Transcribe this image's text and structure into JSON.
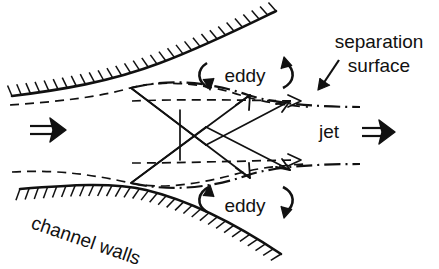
{
  "figure": {
    "background_color": "#ffffff",
    "ink_color": "#111111",
    "width": 439,
    "height": 269
  },
  "labels": {
    "separation_line1": "separation",
    "separation_line2": "surface",
    "jet": "jet",
    "jet_arrow_glyph": "⇒",
    "inlet_arrow_glyph": "⇒",
    "eddy_top": "eddy",
    "eddy_bottom": "eddy",
    "channel_walls": "channel walls"
  },
  "geometry": {
    "top_wall_path": "M 12,96 C 60,90 110,82 160,63 C 205,46 245,26 276,11",
    "bottom_wall_path": "M 20,189 C 70,185 112,182 146,190 C 196,202 245,230 281,254",
    "top_streamline_path": "M 10,105 C 55,102 100,97 130,88 C 160,80 200,82 240,95 C 262,102 290,106 308,107",
    "bottom_streamline_path": "M 12,172 C 58,169 100,176 130,183 C 162,190 200,184 240,173 C 262,167 288,165 306,164",
    "top_sep_surface_path": "M 131,88 C 170,78 210,82 248,95 C 275,104 320,107 360,107",
    "bottom_sep_surface_path": "M 131,183 C 170,192 212,188 248,175 C 276,166 322,164 360,164",
    "top_jet_dash_path": "M 132,101 C 180,99 240,100 296,101",
    "bottom_jet_dash_path": "M 132,163 C 180,163 240,161 296,160",
    "shock_lines": [
      "M 131,88 L 250,178",
      "M 131,88 L 206,145",
      "M 131,183 L 250,95",
      "M 131,183 L 206,127",
      "M 180,110 L 180,160",
      "M 206,145 L 290,101",
      "M 206,127 L 290,170"
    ],
    "vertical_shock": "M 180,110 L 180,160",
    "pointer_to_separation": "M 339,60 L 321,87"
  },
  "hatching": {
    "top_wall_side": "above",
    "bottom_wall_side": "below",
    "tick_length": 11,
    "tick_count_top": 30,
    "tick_count_bottom": 30
  },
  "annotations": {
    "eddy_top_position": "upper recirculation zone between top wall and top separation surface",
    "eddy_bottom_position": "lower recirculation zone between bottom wall and bottom separation surface",
    "flow_direction": "left to right"
  }
}
